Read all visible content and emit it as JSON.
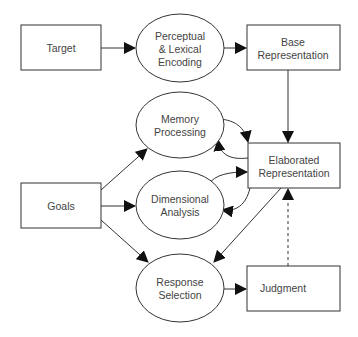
{
  "diagram": {
    "type": "flow-diagram",
    "nodes": {
      "target": {
        "shape": "rectangle",
        "lines": [
          "Target"
        ]
      },
      "perceptual": {
        "shape": "ellipse",
        "lines": [
          "Perceptual",
          "& Lexical",
          "Encoding"
        ]
      },
      "base": {
        "shape": "rectangle",
        "lines": [
          "Base",
          "Representation"
        ]
      },
      "memory": {
        "shape": "ellipse",
        "lines": [
          "Memory",
          "Processing"
        ]
      },
      "elaborated": {
        "shape": "rectangle",
        "lines": [
          "Elaborated",
          "Representation"
        ]
      },
      "goals": {
        "shape": "rectangle",
        "lines": [
          "Goals"
        ]
      },
      "dimensional": {
        "shape": "ellipse",
        "lines": [
          "Dimensional",
          "Analysis"
        ]
      },
      "response": {
        "shape": "ellipse",
        "lines": [
          "Response",
          "Selection"
        ]
      },
      "judgment": {
        "shape": "rectangle",
        "lines": [
          "Judgment"
        ]
      }
    },
    "edges": [
      {
        "from": "Target",
        "to": "Perceptual & Lexical Encoding",
        "style": "solid"
      },
      {
        "from": "Perceptual & Lexical Encoding",
        "to": "Base Representation",
        "style": "solid"
      },
      {
        "from": "Base Representation",
        "to": "Elaborated Representation",
        "style": "solid"
      },
      {
        "from": "Memory Processing",
        "to": "Elaborated Representation",
        "style": "solid"
      },
      {
        "from": "Elaborated Representation",
        "to": "Memory Processing",
        "style": "solid"
      },
      {
        "from": "Dimensional Analysis",
        "to": "Elaborated Representation",
        "style": "solid"
      },
      {
        "from": "Elaborated Representation",
        "to": "Dimensional Analysis",
        "style": "solid"
      },
      {
        "from": "Goals",
        "to": "Memory Processing",
        "style": "solid"
      },
      {
        "from": "Goals",
        "to": "Dimensional Analysis",
        "style": "solid"
      },
      {
        "from": "Goals",
        "to": "Response Selection",
        "style": "solid"
      },
      {
        "from": "Elaborated Representation",
        "to": "Response Selection",
        "style": "solid"
      },
      {
        "from": "Response Selection",
        "to": "Judgment",
        "style": "solid"
      },
      {
        "from": "Judgment",
        "to": "Elaborated Representation",
        "style": "dashed"
      }
    ],
    "colors": {
      "stroke": "#333333",
      "text": "#444444",
      "background": "#ffffff"
    }
  }
}
